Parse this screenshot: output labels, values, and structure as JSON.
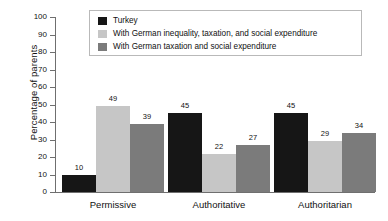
{
  "chart_data": {
    "type": "bar",
    "title": "",
    "xlabel": "",
    "ylabel": "Percentage of parents",
    "ylim": [
      0,
      100
    ],
    "ytick_step": 10,
    "yticks": [
      100,
      90,
      80,
      70,
      60,
      50,
      40,
      30,
      20,
      10,
      0
    ],
    "grid": false,
    "legend_position": "top-center",
    "categories": [
      "Permissive",
      "Authoritative",
      "Authoritarian"
    ],
    "series": [
      {
        "name": "Turkey",
        "color": "#161616",
        "values": [
          10,
          45,
          45
        ]
      },
      {
        "name": "With German inequality, taxation, and social expenditure",
        "color": "#c6c6c6",
        "values": [
          49,
          22,
          29
        ]
      },
      {
        "name": "With German taxation and social expenditure",
        "color": "#7b7b7b",
        "values": [
          39,
          27,
          34
        ]
      }
    ]
  },
  "axis": {
    "line_color": "#6f6f6f"
  },
  "legend": {
    "border_color": "#b9b9b9",
    "background": "#ffffff"
  }
}
